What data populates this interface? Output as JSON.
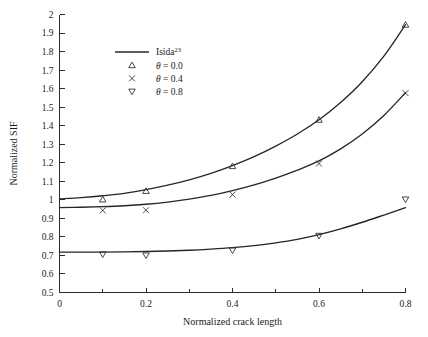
{
  "chart_data": {
    "type": "line",
    "title": "",
    "xlabel": "Normalized crack length",
    "ylabel": "Normalized SIF",
    "xlim": [
      0,
      0.8
    ],
    "ylim": [
      0.5,
      2.0
    ],
    "grid": false,
    "legend_position": "upper-left-inside",
    "x_ticks_major": [
      "0",
      "0.2",
      "0.4",
      "0.6",
      "0.8"
    ],
    "x_ticks_major_values": [
      0,
      0.2,
      0.4,
      0.6,
      0.8
    ],
    "x_ticks_minor_values": [
      0.1,
      0.3,
      0.5,
      0.7
    ],
    "y_ticks": [
      "0.5",
      "0.6",
      "0.7",
      "0.8",
      "0.9",
      "1",
      "1.1",
      "1.2",
      "1.3",
      "1.4",
      "1.5",
      "1.6",
      "1.7",
      "1.8",
      "1.9",
      "2"
    ],
    "y_ticks_values": [
      0.5,
      0.6,
      0.7,
      0.8,
      0.9,
      1.0,
      1.1,
      1.2,
      1.3,
      1.4,
      1.5,
      1.6,
      1.7,
      1.8,
      1.9,
      2.0
    ],
    "reference_curves": [
      {
        "name": "Isida-theta-0.0",
        "x": [
          0.0,
          0.05,
          0.1,
          0.15,
          0.2,
          0.25,
          0.3,
          0.35,
          0.4,
          0.45,
          0.5,
          0.55,
          0.6,
          0.65,
          0.7,
          0.75,
          0.8
        ],
        "y": [
          1.005,
          1.012,
          1.022,
          1.035,
          1.055,
          1.079,
          1.108,
          1.143,
          1.185,
          1.233,
          1.29,
          1.355,
          1.432,
          1.525,
          1.637,
          1.775,
          1.945
        ]
      },
      {
        "name": "Isida-theta-0.4",
        "x": [
          0.0,
          0.05,
          0.1,
          0.15,
          0.2,
          0.25,
          0.3,
          0.35,
          0.4,
          0.45,
          0.5,
          0.55,
          0.6,
          0.65,
          0.7,
          0.75,
          0.8
        ],
        "y": [
          0.958,
          0.96,
          0.963,
          0.968,
          0.976,
          0.988,
          1.004,
          1.024,
          1.05,
          1.081,
          1.117,
          1.16,
          1.21,
          1.275,
          1.355,
          1.455,
          1.578
        ]
      },
      {
        "name": "Isida-theta-0.8",
        "x": [
          0.0,
          0.05,
          0.1,
          0.15,
          0.2,
          0.25,
          0.3,
          0.35,
          0.4,
          0.45,
          0.5,
          0.55,
          0.6,
          0.65,
          0.7,
          0.75,
          0.8
        ],
        "y": [
          0.718,
          0.718,
          0.718,
          0.719,
          0.721,
          0.724,
          0.728,
          0.734,
          0.742,
          0.753,
          0.768,
          0.787,
          0.812,
          0.843,
          0.879,
          0.918,
          0.958
        ]
      }
    ],
    "series": [
      {
        "name": "theta = 0.0",
        "marker": "triangle-up",
        "label_prefix": "θ",
        "label_value": "0.0",
        "x": [
          0.1,
          0.2,
          0.4,
          0.6,
          0.8
        ],
        "y": [
          1.002,
          1.048,
          1.182,
          1.432,
          1.945
        ]
      },
      {
        "name": "theta = 0.4",
        "marker": "cross",
        "label_prefix": "θ",
        "label_value": "0.4",
        "x": [
          0.1,
          0.2,
          0.4,
          0.6,
          0.8
        ],
        "y": [
          0.943,
          0.944,
          1.028,
          1.196,
          1.576
        ]
      },
      {
        "name": "theta = 0.8",
        "marker": "triangle-down",
        "label_prefix": "θ",
        "label_value": "0.8",
        "x": [
          0.1,
          0.2,
          0.4,
          0.6,
          0.8
        ],
        "y": [
          0.706,
          0.7,
          0.727,
          0.806,
          1.002
        ]
      }
    ],
    "legend": [
      {
        "marker": "line",
        "text_main": "Isida",
        "text_sup": "23"
      },
      {
        "marker": "triangle-up",
        "text_main": "θ = 0.0",
        "text_sup": ""
      },
      {
        "marker": "cross",
        "text_main": "θ = 0.4",
        "text_sup": ""
      },
      {
        "marker": "triangle-down",
        "text_main": "θ = 0.8",
        "text_sup": ""
      }
    ],
    "colors": {
      "curve": "#262626",
      "axis": "#2b2b2b",
      "text": "#1a1a1a",
      "background": "#ffffff"
    }
  }
}
